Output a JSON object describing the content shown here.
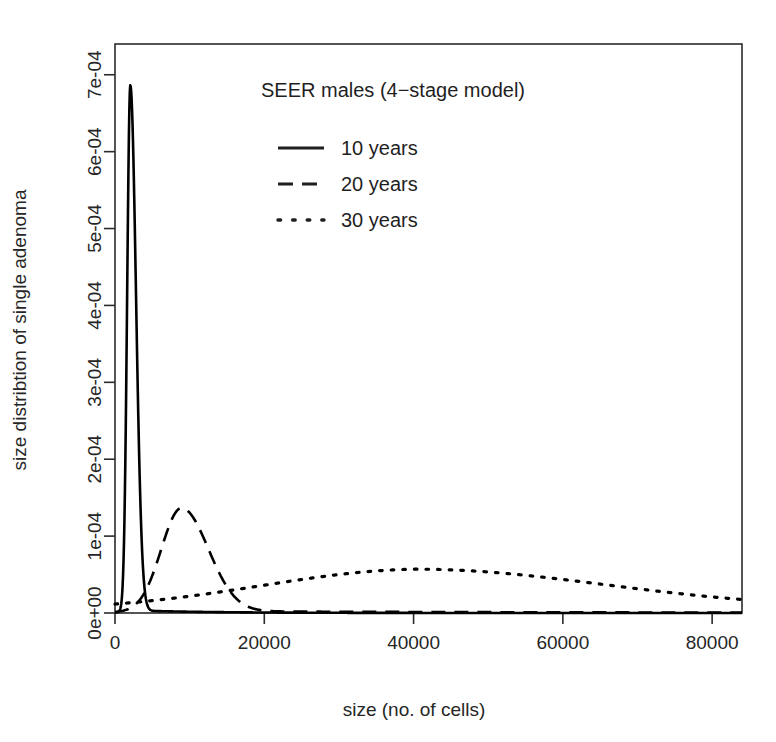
{
  "chart_data": {
    "type": "line",
    "title": "SEER males (4−stage model)",
    "xlabel": "size (no. of cells)",
    "ylabel": "size distribtion of single adenoma",
    "xlim": [
      0,
      84000
    ],
    "ylim": [
      0,
      0.00074
    ],
    "grid": false,
    "legend_position": "top-center-inside",
    "xticks": [
      0,
      20000,
      40000,
      60000,
      80000
    ],
    "xticklabels": [
      "0",
      "20000",
      "40000",
      "60000",
      "80000"
    ],
    "yticks": [
      0,
      0.0001,
      0.0002,
      0.0003,
      0.0004,
      0.0005,
      0.0006,
      0.0007
    ],
    "yticklabels": [
      "0e+00",
      "1e-04",
      "2e-04",
      "3e-04",
      "4e-04",
      "5e-04",
      "6e-04",
      "7e-04"
    ],
    "series": [
      {
        "name": "10 years",
        "style": "solid",
        "color": "#000000",
        "peak_x": 2050,
        "peak_y": 0.000683,
        "sigma_left": 420,
        "sigma_right": 760,
        "tail_level": 3.5e-06
      },
      {
        "name": "20 years",
        "style": "dashed",
        "color": "#000000",
        "peak_x": 8900,
        "peak_y": 0.000134,
        "sigma_left": 2700,
        "sigma_right": 3600,
        "tail_level": 2.5e-06
      },
      {
        "name": "30 years",
        "style": "dotted",
        "color": "#000000",
        "peak_x": 40500,
        "peak_y": 4.95e-05,
        "sigma_left": 21000,
        "sigma_right": 25000,
        "tail_level": 7.5e-06
      }
    ],
    "legend_entries": [
      {
        "label": "10 years",
        "style": "solid"
      },
      {
        "label": "20 years",
        "style": "dashed"
      },
      {
        "label": "30 years",
        "style": "dotted"
      }
    ]
  },
  "axes": {
    "x_title": "size (no. of cells)",
    "y_title": "size distribtion of single adenoma"
  },
  "annotations": {
    "plot_title": "SEER males (4−stage model)"
  }
}
